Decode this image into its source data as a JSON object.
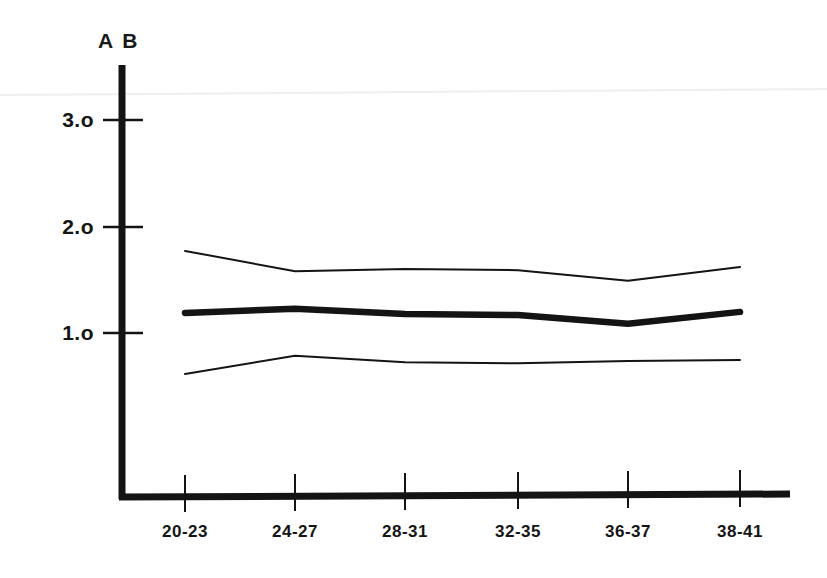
{
  "chart_data": {
    "type": "line",
    "title": "",
    "subtitle": "",
    "corner_label": "A B",
    "xlabel": "",
    "ylabel": "",
    "categories": [
      "20-23",
      "24-27",
      "28-31",
      "32-35",
      "36-37",
      "38-41"
    ],
    "ylim": [
      0,
      3.4
    ],
    "xlim": [
      0,
      7
    ],
    "grid": false,
    "legend_position": "none",
    "ytick_labels": [
      "3.o",
      "2.o",
      "1.o"
    ],
    "ytick_values": [
      3.0,
      2.0,
      1.0
    ],
    "series": [
      {
        "name": "upper-bound",
        "style": "thin",
        "values": [
          2.3,
          2.11,
          2.13,
          2.12,
          2.02,
          2.15
        ]
      },
      {
        "name": "mean",
        "style": "thick",
        "values": [
          1.72,
          1.76,
          1.71,
          1.7,
          1.62,
          1.73
        ]
      },
      {
        "name": "lower-bound",
        "style": "thin",
        "values": [
          1.15,
          1.32,
          1.26,
          1.25,
          1.27,
          1.28
        ]
      }
    ],
    "colors": {
      "ink": "#141414",
      "background": "#ffffff",
      "artifact": "#efefef"
    }
  },
  "geometry": {
    "axis_x": 120,
    "axis_top": 65,
    "baseline_y": 497,
    "baseline_right": 790,
    "tick_x": [
      185,
      295,
      405,
      518,
      628,
      740
    ],
    "ytick_y": [
      120,
      227,
      333
    ],
    "unit_px": 107
  }
}
